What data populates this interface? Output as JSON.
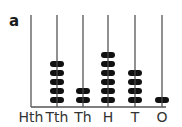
{
  "figure_label": "a",
  "abacus": {
    "columns": [
      {
        "label": "Hth",
        "beads": 0
      },
      {
        "label": "Tth",
        "beads": 5
      },
      {
        "label": "Th",
        "beads": 2
      },
      {
        "label": "H",
        "beads": 6
      },
      {
        "label": "T",
        "beads": 4
      },
      {
        "label": "O",
        "beads": 1
      }
    ],
    "value": "52641",
    "bead_color": "#111111",
    "rod_color": "#555555"
  }
}
